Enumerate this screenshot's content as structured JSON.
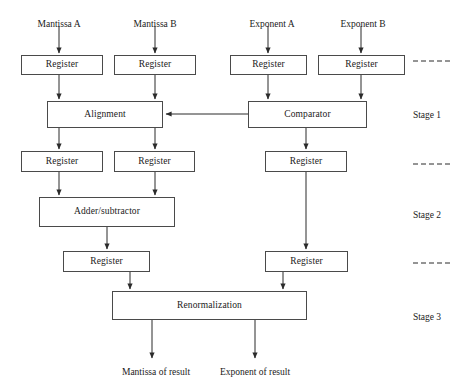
{
  "diagram": {
    "colors": {
      "stroke": "#4a4a4a",
      "wire": "#2b2b2b",
      "text": "#1a1a1a",
      "background": "#ffffff"
    },
    "inputs": [
      {
        "id": "mantissa-a",
        "label": "Mantissa A",
        "x": 59,
        "y": 20
      },
      {
        "id": "mantissa-b",
        "label": "Mantissa B",
        "x": 155,
        "y": 20
      },
      {
        "id": "exponent-a",
        "label": "Exponent A",
        "x": 272,
        "y": 20
      },
      {
        "id": "exponent-b",
        "label": "Exponent B",
        "x": 363,
        "y": 20
      }
    ],
    "outputs": [
      {
        "id": "mantissa-of-result",
        "label": "Mantissa of result",
        "x": 156,
        "y": 368
      },
      {
        "id": "exponent-of-result",
        "label": "Exponent of result",
        "x": 255,
        "y": 368
      }
    ],
    "blocks": [
      {
        "id": "register-mantissa-a",
        "label": "Register",
        "x": 21,
        "y": 55,
        "w": 82,
        "h": 20
      },
      {
        "id": "register-mantissa-b",
        "label": "Register",
        "x": 114,
        "y": 55,
        "w": 82,
        "h": 20
      },
      {
        "id": "register-exponent-a",
        "label": "Register",
        "x": 230,
        "y": 55,
        "w": 77,
        "h": 20
      },
      {
        "id": "register-exponent-b",
        "label": "Register",
        "x": 318,
        "y": 55,
        "w": 87,
        "h": 20
      },
      {
        "id": "alignment",
        "label": "Alignment",
        "x": 47,
        "y": 101,
        "w": 116,
        "h": 27
      },
      {
        "id": "comparator",
        "label": "Comparator",
        "x": 248,
        "y": 101,
        "w": 119,
        "h": 27
      },
      {
        "id": "register-aligned-mantissa-a",
        "label": "Register",
        "x": 21,
        "y": 151,
        "w": 82,
        "h": 21
      },
      {
        "id": "register-aligned-mantissa-b",
        "label": "Register",
        "x": 114,
        "y": 151,
        "w": 81,
        "h": 21
      },
      {
        "id": "register-exponent-stage1",
        "label": "Register",
        "x": 265,
        "y": 151,
        "w": 82,
        "h": 21
      },
      {
        "id": "adder-subtractor",
        "label": "Adder/subtractor",
        "x": 39,
        "y": 197,
        "w": 136,
        "h": 30
      },
      {
        "id": "register-sum",
        "label": "Register",
        "x": 63,
        "y": 251,
        "w": 87,
        "h": 21
      },
      {
        "id": "register-exponent-stage2",
        "label": "Register",
        "x": 265,
        "y": 251,
        "w": 83,
        "h": 21
      },
      {
        "id": "renormalization",
        "label": "Renormalization",
        "x": 112,
        "y": 291,
        "w": 195,
        "h": 29
      }
    ],
    "stages": [
      {
        "id": "stage-1",
        "label": "Stage 1",
        "x": 427,
        "y": 111
      },
      {
        "id": "stage-2",
        "label": "Stage 2",
        "x": 427,
        "y": 211
      },
      {
        "id": "stage-3",
        "label": "Stage 3",
        "x": 427,
        "y": 313
      }
    ],
    "stage_dividers": [
      {
        "id": "divider-1",
        "x1": 413,
        "x2": 453,
        "y": 61
      },
      {
        "id": "divider-2",
        "x1": 413,
        "x2": 453,
        "y": 164
      },
      {
        "id": "divider-3",
        "x1": 413,
        "x2": 453,
        "y": 263
      }
    ],
    "wires": [
      {
        "id": "wire-mantissa-a-in",
        "points": "59,26 59,53",
        "arrow": true
      },
      {
        "id": "wire-mantissa-b-in",
        "points": "155,26 155,53",
        "arrow": true
      },
      {
        "id": "wire-exponent-a-in",
        "points": "268,26 268,53",
        "arrow": true
      },
      {
        "id": "wire-exponent-b-in",
        "points": "361,26 361,53",
        "arrow": true
      },
      {
        "id": "wire-reg-ma-to-alignment",
        "points": "59,75 59,99",
        "arrow": true
      },
      {
        "id": "wire-reg-mb-to-alignment",
        "points": "155,75 155,99",
        "arrow": true
      },
      {
        "id": "wire-reg-ea-to-comparator",
        "points": "268,75 268,99",
        "arrow": true
      },
      {
        "id": "wire-reg-eb-to-comparator",
        "points": "361,75 361,99",
        "arrow": true
      },
      {
        "id": "wire-comparator-to-alignment",
        "points": "248,114 166,114",
        "arrow": true
      },
      {
        "id": "wire-alignment-to-reg-a",
        "points": "59,128 59,149",
        "arrow": true
      },
      {
        "id": "wire-alignment-to-reg-b",
        "points": "155,128 155,149",
        "arrow": true
      },
      {
        "id": "wire-comparator-to-reg-e",
        "points": "306,128 306,149",
        "arrow": true
      },
      {
        "id": "wire-reg-a-to-adder",
        "points": "59,172 59,195",
        "arrow": true
      },
      {
        "id": "wire-reg-b-to-adder",
        "points": "155,172 155,195",
        "arrow": true
      },
      {
        "id": "wire-adder-to-reg-sum",
        "points": "107,227 107,249",
        "arrow": true
      },
      {
        "id": "wire-reg-e-stage1-to-stage2",
        "points": "306,172 306,249",
        "arrow": true
      },
      {
        "id": "wire-reg-sum-to-renorm",
        "points": "130,272 130,289",
        "arrow": true
      },
      {
        "id": "wire-reg-e-stage2-to-renorm",
        "points": "283,272 283,289",
        "arrow": true
      },
      {
        "id": "wire-renorm-to-mantissa-out",
        "points": "152,320 152,358",
        "arrow": true
      },
      {
        "id": "wire-renorm-to-exponent-out",
        "points": "255,320 255,358",
        "arrow": true
      }
    ]
  }
}
